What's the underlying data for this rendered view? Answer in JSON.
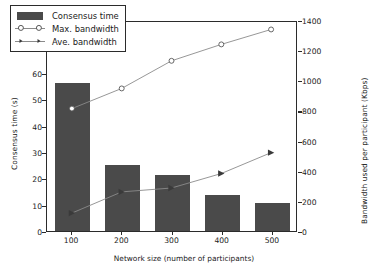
{
  "chart_data": {
    "type": "bar",
    "title": "",
    "xlabel": "Network size (number of participants)",
    "ylabel": "Consensus time (s)",
    "y2label": "Bandwidth used per participant (Kbps)",
    "categories": [
      "100",
      "200",
      "300",
      "400",
      "500"
    ],
    "x": [
      100,
      200,
      300,
      400,
      500
    ],
    "ylim": [
      0,
      80
    ],
    "y2lim": [
      0,
      1400
    ],
    "yticks": [
      0,
      10,
      20,
      30,
      40,
      50,
      60,
      70,
      80
    ],
    "y2ticks": [
      0,
      200,
      400,
      600,
      800,
      1000,
      1200,
      1400
    ],
    "grid": false,
    "legend_position": "upper left",
    "series": [
      {
        "name": "Consensus time",
        "kind": "bar",
        "axis": "left",
        "unit": "s",
        "color": "#4a4a4a",
        "values": [
          56.0,
          25.2,
          21.4,
          13.7,
          10.5
        ]
      },
      {
        "name": "Max. bandwidth",
        "kind": "line",
        "axis": "right",
        "unit": "Kbps",
        "marker": "circle",
        "color": "#8a8a8a",
        "values": [
          820,
          955,
          1140,
          1250,
          1350
        ]
      },
      {
        "name": "Ave. bandwidth",
        "kind": "line",
        "axis": "right",
        "unit": "Kbps",
        "marker": "triangle-right",
        "color": "#8a8a8a",
        "values": [
          120,
          262,
          288,
          385,
          525
        ]
      }
    ]
  },
  "legend": {
    "items": [
      {
        "label": "Consensus time",
        "key": "bar-swatch"
      },
      {
        "label": "Max. bandwidth",
        "key": "circle-marker-line"
      },
      {
        "label": "Ave. bandwidth",
        "key": "triangle-marker-line"
      }
    ]
  },
  "colors": {
    "bar": "#4a4a4a",
    "line": "#8a8a8a",
    "axis": "#2b2b2b",
    "background": "#ffffff"
  }
}
